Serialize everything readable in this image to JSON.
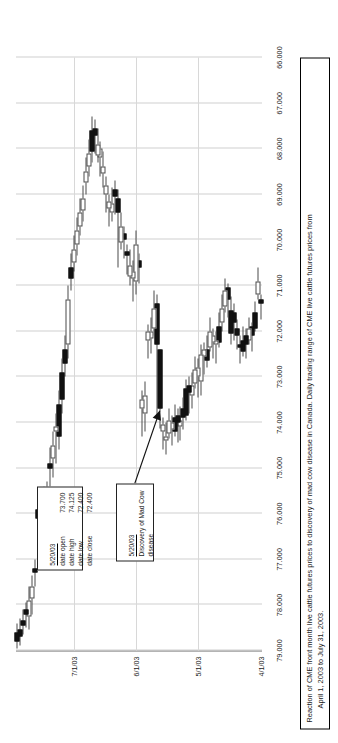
{
  "figure": {
    "caption_line1": "Reaction of CME front month live cattle futures prices to discovery of mad cow disease in Canada.  Daily trading range of CME live cattle futures prices from",
    "caption_line2": "April 1, 2003 to July 31, 2003."
  },
  "annotations": {
    "event": {
      "date": "5/20/03",
      "line1": "Discovery of Mad Cow",
      "line2": "disease"
    },
    "ohlc": {
      "date": "5/20/03",
      "rows": [
        {
          "label": "date open",
          "value": "73.700"
        },
        {
          "label": "date high",
          "value": "74.125"
        },
        {
          "label": "date low",
          "value": "72.400"
        },
        {
          "label": "date close",
          "value": "72.400"
        }
      ]
    }
  },
  "chart_data": {
    "type": "candlestick",
    "title": "",
    "xlabel": "",
    "ylabel": "",
    "grid": true,
    "legend": "none",
    "price_ticks": [
      "79.000",
      "78.000",
      "77.000",
      "76.000",
      "75.000",
      "74.000",
      "73.000",
      "72.000",
      "71.000",
      "70.000",
      "69.000",
      "68.000",
      "67.000",
      "66.000"
    ],
    "ylim": [
      66.0,
      79.0
    ],
    "date_ticks": [
      "4/1/03",
      "5/1/03",
      "6/1/03",
      "7/1/03"
    ],
    "date_tick_index": [
      0,
      21,
      42,
      63
    ],
    "xlim": [
      "4/1/03",
      "7/31/03"
    ],
    "colors": {
      "up_body": "#ffffff",
      "down_body": "#111111",
      "wick": "#4a4a4a",
      "grid": "#cfcfcf",
      "axis": "#6b6b6b"
    },
    "candles": [
      {
        "i": 0,
        "date": "4/1/03",
        "open": 71.4,
        "high": 71.75,
        "low": 71.2,
        "close": 71.3,
        "dir": "down"
      },
      {
        "i": 1,
        "date": "4/2/03",
        "open": 70.9,
        "high": 71.3,
        "low": 70.6,
        "close": 71.2,
        "dir": "up"
      },
      {
        "i": 2,
        "date": "4/3/03",
        "open": 71.6,
        "high": 72.0,
        "low": 71.35,
        "close": 71.95,
        "dir": "down"
      },
      {
        "i": 3,
        "date": "4/4/03",
        "open": 72.1,
        "high": 72.45,
        "low": 71.8,
        "close": 71.9,
        "dir": "down"
      },
      {
        "i": 4,
        "date": "4/7/03",
        "open": 71.95,
        "high": 72.3,
        "low": 71.7,
        "close": 72.2,
        "dir": "up"
      },
      {
        "i": 5,
        "date": "4/8/03",
        "open": 72.3,
        "high": 72.6,
        "low": 71.95,
        "close": 72.1,
        "dir": "down"
      },
      {
        "i": 6,
        "date": "4/9/03",
        "open": 72.2,
        "high": 72.55,
        "low": 71.9,
        "close": 72.45,
        "dir": "down"
      },
      {
        "i": 7,
        "date": "4/10/03",
        "open": 72.35,
        "high": 72.7,
        "low": 72.1,
        "close": 72.3,
        "dir": "down"
      },
      {
        "i": 8,
        "date": "4/11/03",
        "open": 72.1,
        "high": 72.4,
        "low": 71.75,
        "close": 71.95,
        "dir": "down"
      },
      {
        "i": 9,
        "date": "4/14/03",
        "open": 71.8,
        "high": 72.2,
        "low": 71.4,
        "close": 71.6,
        "dir": "down"
      },
      {
        "i": 10,
        "date": "4/15/03",
        "open": 71.55,
        "high": 72.3,
        "low": 71.25,
        "close": 72.05,
        "dir": "down"
      },
      {
        "i": 11,
        "date": "4/16/03",
        "open": 71.3,
        "high": 71.7,
        "low": 70.95,
        "close": 71.05,
        "dir": "down"
      },
      {
        "i": 12,
        "date": "4/17/03",
        "open": 71.1,
        "high": 71.6,
        "low": 70.85,
        "close": 71.45,
        "dir": "up"
      },
      {
        "i": 13,
        "date": "4/21/03",
        "open": 71.5,
        "high": 72.0,
        "low": 71.2,
        "close": 71.8,
        "dir": "up"
      },
      {
        "i": 14,
        "date": "4/22/03",
        "open": 71.9,
        "high": 72.35,
        "low": 71.6,
        "close": 72.25,
        "dir": "down"
      },
      {
        "i": 15,
        "date": "4/23/03",
        "open": 72.3,
        "high": 72.7,
        "low": 72.0,
        "close": 72.2,
        "dir": "up"
      },
      {
        "i": 16,
        "date": "4/24/03",
        "open": 72.25,
        "high": 72.6,
        "low": 71.95,
        "close": 72.1,
        "dir": "up"
      },
      {
        "i": 17,
        "date": "4/25/03",
        "open": 72.0,
        "high": 72.45,
        "low": 71.7,
        "close": 72.35,
        "dir": "up"
      },
      {
        "i": 18,
        "date": "4/28/03",
        "open": 72.4,
        "high": 72.8,
        "low": 72.1,
        "close": 72.65,
        "dir": "down"
      },
      {
        "i": 19,
        "date": "4/29/03",
        "open": 72.55,
        "high": 72.95,
        "low": 72.25,
        "close": 72.4,
        "dir": "up"
      },
      {
        "i": 20,
        "date": "4/30/03",
        "open": 72.5,
        "high": 73.4,
        "low": 72.3,
        "close": 73.1,
        "dir": "up"
      },
      {
        "i": 21,
        "date": "5/1/03",
        "open": 73.0,
        "high": 73.45,
        "low": 72.6,
        "close": 72.8,
        "dir": "up"
      },
      {
        "i": 22,
        "date": "5/2/03",
        "open": 72.85,
        "high": 73.25,
        "low": 72.55,
        "close": 73.15,
        "dir": "up"
      },
      {
        "i": 23,
        "date": "5/5/03",
        "open": 73.2,
        "high": 73.7,
        "low": 72.9,
        "close": 73.4,
        "dir": "up"
      },
      {
        "i": 24,
        "date": "5/6/03",
        "open": 73.35,
        "high": 73.8,
        "low": 73.0,
        "close": 73.2,
        "dir": "down"
      },
      {
        "i": 25,
        "date": "5/7/03",
        "open": 73.25,
        "high": 73.95,
        "low": 73.05,
        "close": 73.85,
        "dir": "down"
      },
      {
        "i": 26,
        "date": "5/8/03",
        "open": 73.7,
        "high": 74.15,
        "low": 73.45,
        "close": 73.9,
        "dir": "down"
      },
      {
        "i": 27,
        "date": "5/9/03",
        "open": 73.95,
        "high": 74.4,
        "low": 73.65,
        "close": 74.1,
        "dir": "up"
      },
      {
        "i": 28,
        "date": "5/12/03",
        "open": 74.0,
        "high": 74.45,
        "low": 73.7,
        "close": 73.85,
        "dir": "down"
      },
      {
        "i": 29,
        "date": "5/13/03",
        "open": 73.9,
        "high": 74.3,
        "low": 73.6,
        "close": 74.2,
        "dir": "down"
      },
      {
        "i": 30,
        "date": "5/14/03",
        "open": 74.15,
        "high": 74.5,
        "low": 73.85,
        "close": 74.0,
        "dir": "up"
      },
      {
        "i": 31,
        "date": "5/15/03",
        "open": 73.95,
        "high": 74.35,
        "low": 73.7,
        "close": 74.25,
        "dir": "up"
      },
      {
        "i": 32,
        "date": "5/16/03",
        "open": 74.3,
        "high": 74.7,
        "low": 74.0,
        "close": 74.4,
        "dir": "up"
      },
      {
        "i": 33,
        "date": "5/19/03",
        "open": 74.2,
        "high": 74.6,
        "low": 73.9,
        "close": 74.05,
        "dir": "up"
      },
      {
        "i": 34,
        "date": "5/20/03",
        "open": 73.7,
        "high": 74.125,
        "low": 72.4,
        "close": 72.4,
        "dir": "down",
        "event": true
      },
      {
        "i": 35,
        "date": "5/21/03",
        "open": 72.3,
        "high": 73.9,
        "low": 71.2,
        "close": 71.4,
        "dir": "down"
      },
      {
        "i": 36,
        "date": "5/22/03",
        "open": 71.5,
        "high": 72.1,
        "low": 71.1,
        "close": 71.95,
        "dir": "up"
      },
      {
        "i": 37,
        "date": "5/23/03",
        "open": 72.0,
        "high": 72.5,
        "low": 71.7,
        "close": 72.15,
        "dir": "up"
      },
      {
        "i": 38,
        "date": "5/27/03",
        "open": 72.2,
        "high": 72.6,
        "low": 71.85,
        "close": 72.0,
        "dir": "up"
      },
      {
        "i": 39,
        "date": "5/28/03",
        "open": 73.4,
        "high": 74.2,
        "low": 73.1,
        "close": 73.8,
        "dir": "up"
      },
      {
        "i": 40,
        "date": "5/29/03",
        "open": 73.7,
        "high": 74.3,
        "low": 73.3,
        "close": 73.5,
        "dir": "up"
      },
      {
        "i": 41,
        "date": "5/30/03",
        "open": 70.6,
        "high": 70.95,
        "low": 70.3,
        "close": 70.45,
        "dir": "down"
      },
      {
        "i": 42,
        "date": "6/2/03",
        "open": 70.1,
        "high": 71.2,
        "low": 69.8,
        "close": 70.9,
        "dir": "up"
      },
      {
        "i": 43,
        "date": "6/3/03",
        "open": 70.85,
        "high": 71.35,
        "low": 70.45,
        "close": 70.7,
        "dir": "up"
      },
      {
        "i": 44,
        "date": "6/4/03",
        "open": 70.55,
        "high": 71.0,
        "low": 70.2,
        "close": 70.8,
        "dir": "up"
      },
      {
        "i": 45,
        "date": "6/5/03",
        "open": 70.35,
        "high": 70.75,
        "low": 70.1,
        "close": 70.25,
        "dir": "down"
      },
      {
        "i": 46,
        "date": "6/6/03",
        "open": 70.0,
        "high": 70.4,
        "low": 69.7,
        "close": 69.85,
        "dir": "down"
      },
      {
        "i": 47,
        "date": "6/9/03",
        "open": 69.7,
        "high": 70.2,
        "low": 69.4,
        "close": 70.05,
        "dir": "up"
      },
      {
        "i": 48,
        "date": "6/10/03",
        "open": 69.4,
        "high": 70.6,
        "low": 68.9,
        "close": 69.1,
        "dir": "down"
      },
      {
        "i": 49,
        "date": "6/11/03",
        "open": 69.05,
        "high": 69.45,
        "low": 68.7,
        "close": 68.9,
        "dir": "down"
      },
      {
        "i": 50,
        "date": "6/12/03",
        "open": 69.2,
        "high": 69.6,
        "low": 68.85,
        "close": 69.4,
        "dir": "up"
      },
      {
        "i": 51,
        "date": "6/13/03",
        "open": 69.3,
        "high": 69.7,
        "low": 69.0,
        "close": 69.15,
        "dir": "up"
      },
      {
        "i": 52,
        "date": "6/16/03",
        "open": 69.0,
        "high": 69.4,
        "low": 68.6,
        "close": 68.8,
        "dir": "up"
      },
      {
        "i": 53,
        "date": "6/17/03",
        "open": 68.4,
        "high": 68.85,
        "low": 68.05,
        "close": 68.55,
        "dir": "up"
      },
      {
        "i": 54,
        "date": "6/18/03",
        "open": 68.2,
        "high": 68.6,
        "low": 67.85,
        "close": 68.0,
        "dir": "up"
      },
      {
        "i": 55,
        "date": "6/19/03",
        "open": 67.9,
        "high": 68.3,
        "low": 67.55,
        "close": 68.15,
        "dir": "up"
      },
      {
        "i": 56,
        "date": "6/20/03",
        "open": 67.7,
        "high": 68.1,
        "low": 67.35,
        "close": 67.55,
        "dir": "down"
      },
      {
        "i": 57,
        "date": "6/23/03",
        "open": 67.6,
        "high": 68.3,
        "low": 67.3,
        "close": 68.05,
        "dir": "down"
      },
      {
        "i": 58,
        "date": "6/24/03",
        "open": 68.1,
        "high": 68.6,
        "low": 67.8,
        "close": 68.4,
        "dir": "up"
      },
      {
        "i": 59,
        "date": "6/25/03",
        "open": 68.5,
        "high": 69.0,
        "low": 68.2,
        "close": 68.75,
        "dir": "up"
      },
      {
        "i": 60,
        "date": "6/26/03",
        "open": 69.1,
        "high": 69.6,
        "low": 68.8,
        "close": 69.35,
        "dir": "up"
      },
      {
        "i": 61,
        "date": "6/27/03",
        "open": 69.4,
        "high": 69.9,
        "low": 69.1,
        "close": 69.7,
        "dir": "up"
      },
      {
        "i": 62,
        "date": "6/30/03",
        "open": 69.8,
        "high": 70.35,
        "low": 69.5,
        "close": 70.1,
        "dir": "up"
      },
      {
        "i": 63,
        "date": "7/1/03",
        "open": 70.2,
        "high": 70.7,
        "low": 69.9,
        "close": 70.5,
        "dir": "up"
      },
      {
        "i": 64,
        "date": "7/2/03",
        "open": 70.6,
        "high": 71.1,
        "low": 70.3,
        "close": 70.85,
        "dir": "down"
      },
      {
        "i": 65,
        "date": "7/3/03",
        "open": 71.3,
        "high": 72.6,
        "low": 71.0,
        "close": 72.3,
        "dir": "up"
      },
      {
        "i": 66,
        "date": "7/7/03",
        "open": 72.4,
        "high": 73.0,
        "low": 72.1,
        "close": 72.7,
        "dir": "down"
      },
      {
        "i": 67,
        "date": "7/8/03",
        "open": 72.9,
        "high": 73.8,
        "low": 72.6,
        "close": 73.5,
        "dir": "down"
      },
      {
        "i": 68,
        "date": "7/9/03",
        "open": 73.6,
        "high": 74.6,
        "low": 73.3,
        "close": 74.3,
        "dir": "down"
      },
      {
        "i": 69,
        "date": "7/10/03",
        "open": 74.2,
        "high": 74.9,
        "low": 73.8,
        "close": 74.1,
        "dir": "up"
      },
      {
        "i": 70,
        "date": "7/11/03",
        "open": 74.5,
        "high": 75.2,
        "low": 74.2,
        "close": 74.8,
        "dir": "up"
      },
      {
        "i": 71,
        "date": "7/14/03",
        "open": 74.9,
        "high": 75.4,
        "low": 74.55,
        "close": 75.0,
        "dir": "down"
      },
      {
        "i": 72,
        "date": "7/15/03",
        "open": 75.6,
        "high": 76.3,
        "low": 75.3,
        "close": 75.9,
        "dir": "up"
      },
      {
        "i": 73,
        "date": "7/16/03",
        "open": 75.7,
        "high": 76.2,
        "low": 75.4,
        "close": 75.85,
        "dir": "up"
      },
      {
        "i": 74,
        "date": "7/17/03",
        "open": 76.1,
        "high": 76.55,
        "low": 75.6,
        "close": 75.8,
        "dir": "down"
      },
      {
        "i": 75,
        "date": "7/18/03",
        "open": 75.9,
        "high": 76.4,
        "low": 75.6,
        "close": 76.1,
        "dir": "down"
      },
      {
        "i": 76,
        "date": "7/21/03",
        "open": 77.3,
        "high": 77.6,
        "low": 77.0,
        "close": 77.2,
        "dir": "down"
      },
      {
        "i": 77,
        "date": "7/22/03",
        "open": 77.6,
        "high": 78.2,
        "low": 77.35,
        "close": 77.85,
        "dir": "up"
      },
      {
        "i": 78,
        "date": "7/23/03",
        "open": 77.9,
        "high": 78.55,
        "low": 77.6,
        "close": 78.25,
        "dir": "up"
      },
      {
        "i": 79,
        "date": "7/24/03",
        "open": 78.2,
        "high": 78.5,
        "low": 77.95,
        "close": 78.1,
        "dir": "down"
      },
      {
        "i": 80,
        "date": "7/25/03",
        "open": 78.35,
        "high": 78.65,
        "low": 78.1,
        "close": 78.45,
        "dir": "down"
      },
      {
        "i": 81,
        "date": "7/28/03",
        "open": 78.55,
        "high": 78.9,
        "low": 78.3,
        "close": 78.7,
        "dir": "down"
      },
      {
        "i": 82,
        "date": "7/31/03",
        "open": 78.6,
        "high": 78.95,
        "low": 78.4,
        "close": 78.8,
        "dir": "down"
      }
    ]
  }
}
